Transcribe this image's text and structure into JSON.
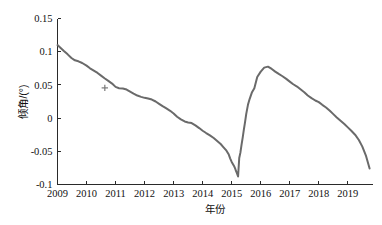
{
  "top_clipped_row": "· · · · · · · · · ·",
  "chart_data": {
    "type": "line",
    "title": "",
    "xlabel": "年份",
    "ylabel": "倾角/(°)",
    "xlim": [
      2009,
      2019.85
    ],
    "ylim": [
      -0.1,
      0.15
    ],
    "grid": false,
    "legend": null,
    "xticks": [
      2009,
      2010,
      2011,
      2012,
      2013,
      2014,
      2015,
      2016,
      2017,
      2018,
      2019
    ],
    "xtick_labels": [
      "2009",
      "2010",
      "2011",
      "2012",
      "2013",
      "2014",
      "2015",
      "2016",
      "2017",
      "2018",
      "2019"
    ],
    "yticks": [
      0.15,
      0.1,
      0.05,
      0,
      -0.05,
      -0.1
    ],
    "ytick_labels": [
      "0.15",
      "0.1",
      "0.05",
      "0",
      "-0.05",
      "-0.1"
    ],
    "series": [
      {
        "name": "倾角",
        "color": "#6a6a6a",
        "x": [
          2009.0,
          2009.1,
          2009.22,
          2009.35,
          2009.48,
          2009.6,
          2009.72,
          2009.85,
          2010.0,
          2010.12,
          2010.25,
          2010.38,
          2010.5,
          2010.62,
          2010.75,
          2010.88,
          2011.0,
          2011.12,
          2011.25,
          2011.38,
          2011.5,
          2011.62,
          2011.75,
          2011.88,
          2012.0,
          2012.12,
          2012.25,
          2012.38,
          2012.5,
          2012.62,
          2012.75,
          2012.88,
          2013.0,
          2013.12,
          2013.25,
          2013.38,
          2013.5,
          2013.62,
          2013.75,
          2013.88,
          2014.0,
          2014.12,
          2014.25,
          2014.38,
          2014.5,
          2014.62,
          2014.72,
          2014.82,
          2014.9,
          2014.95,
          2015.0,
          2015.04,
          2015.08,
          2015.12,
          2015.15,
          2015.18,
          2015.22,
          2015.26,
          2015.3,
          2015.34,
          2015.38,
          2015.42,
          2015.46,
          2015.5,
          2015.56,
          2015.62,
          2015.7,
          2015.78,
          2015.88,
          2016.0,
          2016.12,
          2016.25,
          2016.38,
          2016.5,
          2016.62,
          2016.75,
          2016.88,
          2017.0,
          2017.12,
          2017.25,
          2017.38,
          2017.5,
          2017.62,
          2017.75,
          2017.88,
          2018.0,
          2018.12,
          2018.25,
          2018.38,
          2018.5,
          2018.62,
          2018.75,
          2018.88,
          2019.0,
          2019.12,
          2019.25,
          2019.38,
          2019.5,
          2019.62,
          2019.75
        ],
        "y": [
          0.11,
          0.106,
          0.101,
          0.096,
          0.0905,
          0.087,
          0.0855,
          0.083,
          0.079,
          0.075,
          0.0715,
          0.068,
          0.064,
          0.06,
          0.056,
          0.052,
          0.047,
          0.045,
          0.0445,
          0.043,
          0.04,
          0.037,
          0.034,
          0.032,
          0.0305,
          0.0295,
          0.028,
          0.025,
          0.0215,
          0.018,
          0.0145,
          0.011,
          0.007,
          0.002,
          -0.002,
          -0.005,
          -0.0065,
          -0.0075,
          -0.011,
          -0.015,
          -0.019,
          -0.0225,
          -0.026,
          -0.03,
          -0.0345,
          -0.039,
          -0.044,
          -0.049,
          -0.055,
          -0.061,
          -0.066,
          -0.069,
          -0.072,
          -0.076,
          -0.08,
          -0.083,
          -0.088,
          -0.06,
          -0.052,
          -0.04,
          -0.029,
          -0.017,
          -0.006,
          0.006,
          0.02,
          0.029,
          0.039,
          0.045,
          0.062,
          0.07,
          0.076,
          0.0775,
          0.074,
          0.07,
          0.0665,
          0.063,
          0.059,
          0.055,
          0.051,
          0.0475,
          0.043,
          0.039,
          0.034,
          0.03,
          0.0265,
          0.024,
          0.02,
          0.016,
          0.011,
          0.006,
          0.001,
          -0.004,
          -0.009,
          -0.014,
          -0.019,
          -0.025,
          -0.033,
          -0.043,
          -0.056,
          -0.076
        ]
      }
    ],
    "markers": [
      {
        "name": "cross-marker",
        "x": 2010.63,
        "y": 0.0455
      }
    ]
  }
}
